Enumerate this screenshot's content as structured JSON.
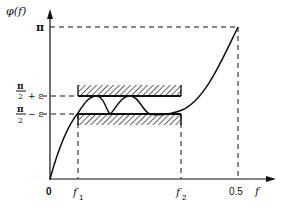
{
  "diagram": {
    "y_axis_label": "φ(f)",
    "x_axis_label": "f",
    "y_ticks": {
      "pi": "π",
      "upper": {
        "num": "π",
        "den": "2",
        "suffix": "+ ε"
      },
      "lower": {
        "num": "π",
        "den": "2",
        "suffix": "− ε"
      }
    },
    "x_ticks": {
      "origin": "0",
      "f1": {
        "base": "f",
        "sub": "1"
      },
      "f2": {
        "base": "f",
        "sub": "2"
      },
      "half": "0.5"
    },
    "band_description": "Hatched tolerance band between π/2 − ε and π/2 + ε from f1 to f2",
    "curve_description": "Phase φ(f) rising from 0, oscillating within the band between f1 and f2, then rising to π at f = 0.5",
    "colors": {
      "ink": "#111111",
      "background": "#ffffff"
    }
  }
}
